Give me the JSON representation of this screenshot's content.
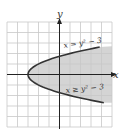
{
  "chart_data": {
    "type": "area",
    "title": "",
    "xlabel": "x",
    "ylabel": "y",
    "xlim": [
      -5,
      5
    ],
    "ylim": [
      -5,
      5
    ],
    "grid": true,
    "curves": [
      {
        "name": "boundary",
        "label": "x = y^2 - 3",
        "equation": "x = y^2 - 3",
        "style": "solid"
      }
    ],
    "shaded_region": {
      "label": "x ≥ y^2 - 3",
      "inequality": "x >= y^2 - 3",
      "color": "#d4d4d4"
    },
    "vertex": [
      -3,
      0
    ]
  },
  "labels": {
    "y_axis": "y",
    "x_axis": "x",
    "curve": "x = y² − 3",
    "region": "x ≥ y² − 3"
  },
  "colors": {
    "grid": "#c8c8c8",
    "axis": "#222222",
    "curve": "#333333",
    "shade": "#d4d4d4"
  }
}
